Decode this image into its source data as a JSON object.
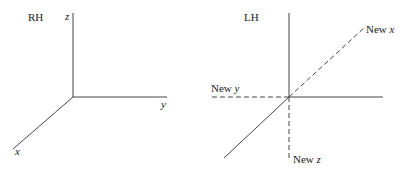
{
  "rh_panel": {
    "title": "RH",
    "axes": {
      "x": "x",
      "y": "y",
      "z": "z"
    }
  },
  "lh_panel": {
    "title": "LH",
    "new_x": {
      "prefix": "New ",
      "var": "x"
    },
    "new_y": {
      "prefix": "New ",
      "var": "y"
    },
    "new_z": {
      "prefix": "New ",
      "var": "z"
    }
  },
  "colors": {
    "line": "#444444",
    "text": "#222222"
  }
}
